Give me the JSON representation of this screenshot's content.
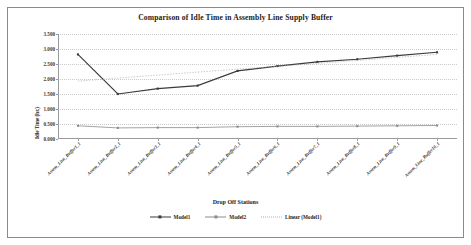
{
  "frame": {
    "border_color": "#8a8a8a",
    "background": "#ffffff"
  },
  "chart_data": {
    "type": "line",
    "title": "Comparison of Idle Time in Assembly Line Supply Buffer",
    "xlabel": "Drop Off Stations",
    "ylabel": "Idle Time (hr.)",
    "grid": true,
    "legend_position": "bottom",
    "ylim": [
      0.0,
      3.5
    ],
    "yticks": [
      0.0,
      0.5,
      1.0,
      1.5,
      2.0,
      2.5,
      3.0,
      3.5
    ],
    "ytick_labels": [
      "0.000",
      "0.500",
      "1.000",
      "1.500",
      "2.000",
      "2.500",
      "3.000",
      "3.500"
    ],
    "categories": [
      "Assem_Line_Buffer1_1",
      "Assem_Line_Buffer2_1",
      "Assem_Line_Buffer3_1",
      "Assem_Line_Buffer4_1",
      "Assem_Line_Buffer5_1",
      "Assem_Line_Buffer6_1",
      "Assem_Line_Buffer7_1",
      "Assem_Line_Buffer8_1",
      "Assem_Line_Buffer9_1",
      "Assem_Line_Buffer10_1"
    ],
    "series": [
      {
        "name": "Model1",
        "style": "solid",
        "color": "#3a3a3a",
        "marker": "square",
        "values": [
          2.82,
          1.5,
          1.68,
          1.78,
          2.27,
          2.43,
          2.57,
          2.66,
          2.78,
          2.89
        ]
      },
      {
        "name": "Model2",
        "style": "solid",
        "color": "#8c8c8c",
        "marker": "square",
        "values": [
          0.44,
          0.37,
          0.38,
          0.38,
          0.41,
          0.42,
          0.42,
          0.43,
          0.44,
          0.45
        ]
      },
      {
        "name": "Linear (Model1)",
        "style": "dotted",
        "color": "#b0b0b0",
        "marker": "none",
        "values": [
          1.93,
          2.03,
          2.13,
          2.23,
          2.33,
          2.42,
          2.52,
          2.62,
          2.72,
          2.82
        ]
      }
    ]
  },
  "legend": {
    "items": [
      {
        "label": "Model1"
      },
      {
        "label": "Model2"
      },
      {
        "label": "Linear (Model1)"
      }
    ]
  }
}
